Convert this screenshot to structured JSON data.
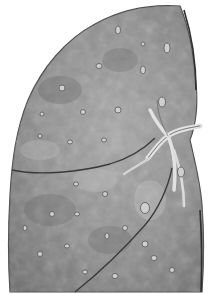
{
  "image": {
    "subject": "lung cross-section illustration",
    "style": "grayscale pencil drawing",
    "colors": {
      "background": "#ffffff",
      "tissue_light": "#b8b8b8",
      "tissue_mid": "#8f8f8f",
      "tissue_dark": "#5e5e5e",
      "outline": "#3a3a3a",
      "vessel": "#d8d8d8"
    }
  }
}
